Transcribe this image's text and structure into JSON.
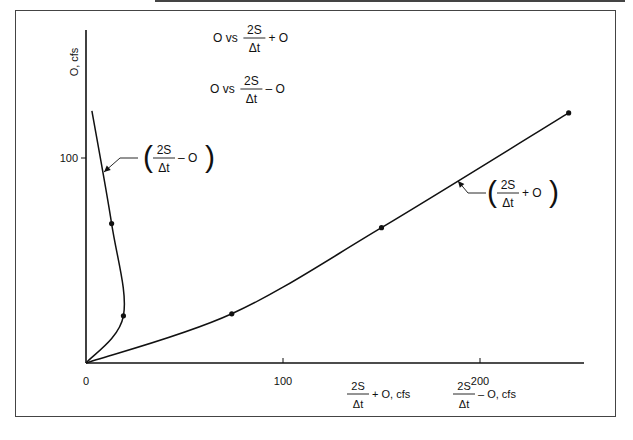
{
  "chart_data": {
    "type": "line",
    "title": "",
    "xlabel": "",
    "ylabel": "O, cfs",
    "xlim": [
      0,
      250
    ],
    "ylim": [
      0,
      125
    ],
    "x_ticks": [
      {
        "value": 0,
        "label": "0"
      },
      {
        "value": 100,
        "label": "100"
      },
      {
        "value": 200,
        "label": "200"
      }
    ],
    "y_ticks": [
      {
        "value": 100,
        "label": "100"
      }
    ],
    "x_axis_labels": [
      {
        "num": "2S",
        "den": "Δt",
        "suffix": "+ O, cfs"
      },
      {
        "num": "2S",
        "den": "Δt",
        "suffix": "– O, cfs"
      }
    ],
    "legend_text": [
      {
        "prefix": "O vs",
        "num": "2S",
        "den": "Δt",
        "suffix": "+ O"
      },
      {
        "prefix": "O vs",
        "num": "2S",
        "den": "Δt",
        "suffix": "– O"
      }
    ],
    "series": [
      {
        "name": "(2S/Δt + O)",
        "label": {
          "num": "2S",
          "den": "Δt",
          "op": "+ O"
        },
        "points": [
          [
            0,
            0
          ],
          [
            74,
            24
          ],
          [
            150,
            66
          ],
          [
            245,
            122
          ]
        ],
        "markers": [
          [
            74,
            24
          ],
          [
            150,
            66
          ],
          [
            245,
            122
          ]
        ]
      },
      {
        "name": "(2S/Δt − O)",
        "label": {
          "num": "2S",
          "den": "Δt",
          "op": "– O"
        },
        "points": [
          [
            0,
            0
          ],
          [
            19,
            23
          ],
          [
            13,
            68
          ],
          [
            3,
            123
          ]
        ],
        "markers": [
          [
            19,
            23
          ],
          [
            13,
            68
          ]
        ]
      }
    ],
    "grid": false,
    "legend": "top-center"
  }
}
